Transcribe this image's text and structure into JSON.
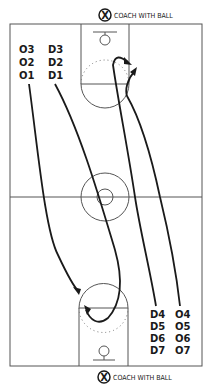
{
  "diagram": {
    "coach_top": {
      "symbol": "X",
      "label": "COACH WITH BALL"
    },
    "coach_bottom": {
      "symbol": "X",
      "label": "COACH WITH BALL"
    },
    "top_left_offense": [
      "O3",
      "O2",
      "O1"
    ],
    "top_left_defense": [
      "D3",
      "D2",
      "D1"
    ],
    "bottom_right_defense": [
      "D4",
      "D5",
      "D6",
      "D7"
    ],
    "bottom_right_offense": [
      "O4",
      "O5",
      "O6",
      "O7"
    ],
    "colors": {
      "line": "#1a1a1a",
      "court": "#555555",
      "background": "#ffffff"
    }
  }
}
